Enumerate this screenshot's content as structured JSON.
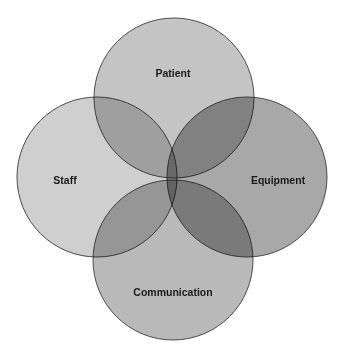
{
  "diagram": {
    "type": "venn",
    "sets": [
      {
        "id": "patient",
        "label": "Patient",
        "cx": 174,
        "cy": 98,
        "r": 80,
        "fill": "#c4c4c4"
      },
      {
        "id": "staff",
        "label": "Staff",
        "cx": 97,
        "cy": 177,
        "r": 80,
        "fill": "#cfcfcf"
      },
      {
        "id": "equipment",
        "label": "Equipment",
        "cx": 247,
        "cy": 177,
        "r": 80,
        "fill": "#a8a8a8"
      },
      {
        "id": "communication",
        "label": "Communication",
        "cx": 173,
        "cy": 260,
        "r": 80,
        "fill": "#b9b9b9"
      }
    ],
    "labels": {
      "patient": {
        "text": "Patient",
        "x": 173,
        "y": 77
      },
      "staff": {
        "text": "Staff",
        "x": 65,
        "y": 184
      },
      "equipment": {
        "text": "Equipment",
        "x": 278,
        "y": 184
      },
      "communication": {
        "text": "Communication",
        "x": 173,
        "y": 296
      }
    }
  }
}
